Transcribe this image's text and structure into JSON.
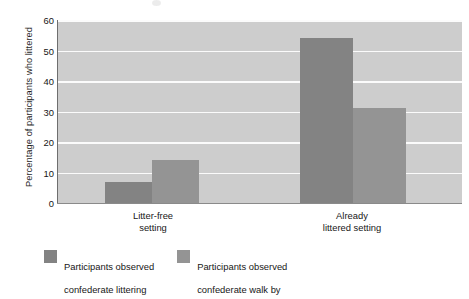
{
  "chart_data": {
    "type": "bar",
    "title": "",
    "subtitle": "",
    "xlabel": "",
    "ylabel": "Percentage of participants who littered",
    "ylim": [
      0,
      60
    ],
    "yticks": [
      0,
      10,
      20,
      30,
      40,
      50,
      60
    ],
    "ytick_labels": [
      "0",
      "10",
      "20",
      "30",
      "40",
      "50",
      "60"
    ],
    "grid": "horizontal-only",
    "legend_position": "bottom-left",
    "categories": [
      "Litter-free setting",
      "Already littered setting"
    ],
    "category_label_lines": [
      [
        "Litter-free",
        "setting"
      ],
      [
        "Already",
        "littered setting"
      ]
    ],
    "series": [
      {
        "name": "Participants observed confederate littering",
        "name_lines": [
          "Participants observed",
          "confederate littering"
        ],
        "color": "#838383",
        "values": [
          7,
          54
        ]
      },
      {
        "name": "Participants observed confederate walk by",
        "name_lines": [
          "Participants observed",
          "confederate walk by"
        ],
        "color": "#949494",
        "values": [
          14,
          31
        ]
      }
    ],
    "colors": {
      "plot_background": "#cdcdcd",
      "gridline": "#fbfbfb",
      "axis": "#777777",
      "series_1": "#838383",
      "series_2": "#949494",
      "text": "#1c1c1c",
      "page_background": "#ffffff"
    }
  }
}
